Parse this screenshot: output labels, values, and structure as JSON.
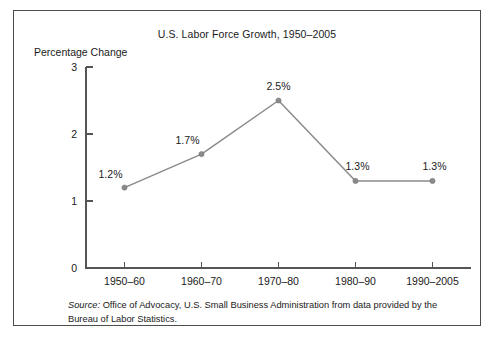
{
  "figure": {
    "title": "U.S. Labor Force Growth, 1950–2005",
    "y_axis_title": "Percentage Change",
    "source_label": "Source:",
    "source_text": " Office of Advocacy, U.S. Small Business Administration from data provided by the Bureau of Labor Statistics."
  },
  "colors": {
    "line": "#8a8a8a",
    "marker": "#8a8a8a",
    "axis": "#555555",
    "text": "#1a1a1a",
    "border": "#4d4d4d",
    "background": "#ffffff"
  },
  "chart_data": {
    "type": "line",
    "title": "U.S. Labor Force Growth, 1950–2005",
    "xlabel": "",
    "ylabel": "Percentage Change",
    "categories": [
      "1950–60",
      "1960–70",
      "1970–80",
      "1980–90",
      "1990–2005"
    ],
    "values": [
      1.2,
      1.7,
      2.5,
      1.3,
      1.3
    ],
    "point_labels": [
      "1.2%",
      "1.7%",
      "2.5%",
      "1.3%",
      "1.3%"
    ],
    "ylim": [
      0,
      3
    ],
    "yticks": [
      0,
      1,
      2,
      3
    ],
    "ytick_labels": [
      "0",
      "1",
      "2",
      "3"
    ],
    "grid": false,
    "legend": false,
    "markers": true,
    "series": [
      {
        "name": "Labor force growth",
        "values": [
          1.2,
          1.7,
          2.5,
          1.3,
          1.3
        ]
      }
    ]
  }
}
